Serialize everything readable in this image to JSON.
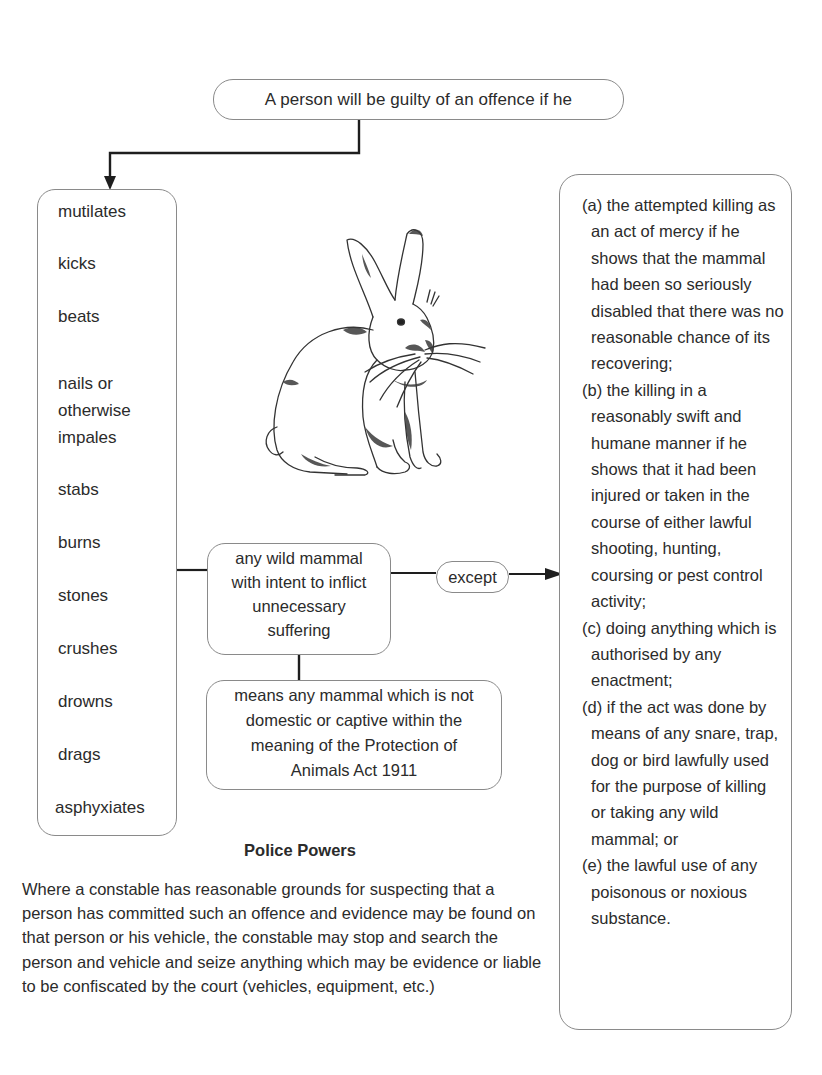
{
  "diagram": {
    "title_box": "A person will be guilty of an offence if he",
    "actions": [
      "mutilates",
      "kicks",
      "beats",
      "nails or otherwise impales",
      "stabs",
      "burns",
      "stones",
      "crushes",
      "drowns",
      "drags",
      "asphyxiates"
    ],
    "nails_lines": [
      "nails or",
      "otherwise",
      "impales"
    ],
    "victim_box": [
      "any wild mammal",
      "with intent to inflict",
      "unnecessary",
      "suffering"
    ],
    "connector_label": "except",
    "definition_box": [
      "means any mammal which is not",
      "domestic or captive within the",
      "meaning of the Protection of",
      "Animals Act 1911"
    ],
    "exceptions": [
      "(a) the attempted killing as an act of mercy if he shows that the mammal had been so seriously disabled that there was no reasonable chance of its recovering;",
      "(b) the killing in a reasonably swift and humane manner if he shows that it had been injured or taken in the course of either lawful shooting, hunting, coursing or pest control activity;",
      "(c) doing anything which is authorised by any enactment;",
      "(d) if the act was done by means of any snare, trap, dog or bird lawfully used for the purpose of killing or taking any wild mammal; or",
      "(e) the lawful use of any poisonous or noxious substance."
    ],
    "illustration": "rabbit-illustration"
  },
  "police_powers": {
    "title": "Police Powers",
    "text": "Where a constable has reasonable grounds for suspecting that a person has committed such an offence and evidence may be found on that person or his vehicle, the constable may stop and search the person and vehicle and seize anything which may be evidence or liable to be confiscated by the court (vehicles, equipment, etc.)"
  },
  "colors": {
    "text": "#2b2b2b",
    "box_border": "#8a8a8a",
    "connector": "#1e1e1e",
    "background": "#ffffff"
  }
}
